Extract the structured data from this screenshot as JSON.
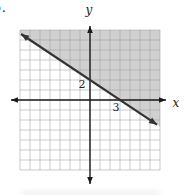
{
  "page": {
    "problem_number_fragment": "5.",
    "background_color": "#ffffff"
  },
  "chart_data": {
    "type": "line",
    "xlabel": "x",
    "ylabel": "y",
    "xlim": [
      -7,
      7
    ],
    "ylim": [
      -7,
      7
    ],
    "grid": true,
    "grid_color": "#b6b6b6",
    "shade_color": "rgba(150,150,150,0.45)",
    "line_color": "#333333",
    "axis_color": "#1a1a1a",
    "series": [
      {
        "name": "boundary-line",
        "points": [
          [
            0,
            2
          ],
          [
            3,
            0
          ]
        ],
        "y_intercept": 2,
        "x_intercept": 3,
        "slope": -0.667,
        "style": "solid-with-arrows"
      }
    ],
    "shaded_region": "above-line",
    "x_tick_label": "3",
    "y_tick_label": "2"
  }
}
